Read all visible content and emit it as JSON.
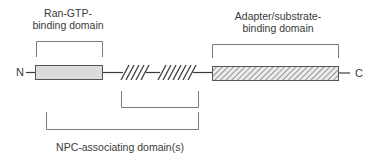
{
  "diagram": {
    "labels": {
      "ran_gtp_line1": "Ran-GTP-",
      "ran_gtp_line2": "binding domain",
      "adapter_line1": "Adapter/substrate-",
      "adapter_line2": "binding domain",
      "npc": "NPC-associating domain(s)",
      "n_terminus": "N",
      "c_terminus": "C"
    },
    "colors": {
      "ran_box_fill": "#dcdcdc",
      "line": "#3c3c3c",
      "bracket": "#7a7a7a",
      "hatch": "#5a5a5a"
    }
  }
}
